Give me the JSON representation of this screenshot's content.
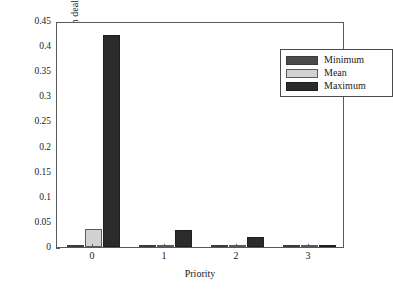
{
  "chart_data": {
    "type": "bar",
    "title": "",
    "subtitle": "",
    "xlabel": "Priority",
    "ylabel": "Message completion dealy (s)",
    "categories": [
      "0",
      "1",
      "2",
      "3"
    ],
    "series": [
      {
        "name": "Minimum",
        "color": "#4a4a4a",
        "values": [
          0.0005,
          0.0006,
          0.0006,
          0.0006
        ]
      },
      {
        "name": "Mean",
        "color": "#d2d2d2",
        "values": [
          0.035,
          0.004,
          0.002,
          0.001
        ]
      },
      {
        "name": "Maximum",
        "color": "#2b2b2b",
        "values": [
          0.423,
          0.033,
          0.019,
          0.005
        ]
      }
    ],
    "ylim": [
      0,
      0.45
    ],
    "xlim": [
      0,
      4
    ],
    "yticks": [
      "0",
      "0.05",
      "0.1",
      "0.15",
      "0.2",
      "0.25",
      "0.3",
      "0.35",
      "0.4",
      "0.45"
    ],
    "ytick_values": [
      0,
      0.05,
      0.1,
      0.15,
      0.2,
      0.25,
      0.3,
      0.35,
      0.4,
      0.45
    ],
    "grid": false,
    "legend_position": "top-right",
    "legend_entries": [
      "Minimum",
      "Mean",
      "Maximum"
    ]
  },
  "axes": {
    "y_label": "Message completion dealy (s)",
    "x_label": "Priority"
  }
}
